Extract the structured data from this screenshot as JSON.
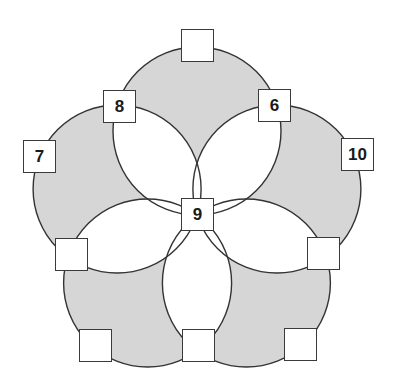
{
  "diagram": {
    "colors": {
      "circle_fill": "#d6d6d6",
      "overlap_fill": "#ffffff",
      "stroke": "#333333",
      "box_fill": "#ffffff"
    },
    "center": {
      "x": 197,
      "y": 215
    },
    "circle_radius": 84,
    "circles": [
      {
        "cx": 197,
        "cy": 131
      },
      {
        "cx": 276.9,
        "cy": 189
      },
      {
        "cx": 246.4,
        "cy": 283
      },
      {
        "cx": 147.6,
        "cy": 283
      },
      {
        "cx": 117.1,
        "cy": 189
      }
    ],
    "boxes": [
      {
        "id": "center",
        "label": "9",
        "x": 181,
        "y": 198
      },
      {
        "id": "top-outer",
        "label": "",
        "x": 181,
        "y": 29
      },
      {
        "id": "upper-left-inner",
        "label": "8",
        "x": 103,
        "y": 90
      },
      {
        "id": "upper-right-inner",
        "label": "6",
        "x": 258,
        "y": 89
      },
      {
        "id": "left-outer",
        "label": "7",
        "x": 23,
        "y": 140
      },
      {
        "id": "right-outer",
        "label": "10",
        "x": 341,
        "y": 138
      },
      {
        "id": "lower-left-inner",
        "label": "",
        "x": 55,
        "y": 238
      },
      {
        "id": "lower-right-inner",
        "label": "",
        "x": 307,
        "y": 237
      },
      {
        "id": "bottom-left-outer",
        "label": "",
        "x": 79,
        "y": 329
      },
      {
        "id": "bottom-middle-inner",
        "label": "",
        "x": 182,
        "y": 329
      },
      {
        "id": "bottom-right-outer",
        "label": "",
        "x": 284,
        "y": 328
      }
    ]
  }
}
